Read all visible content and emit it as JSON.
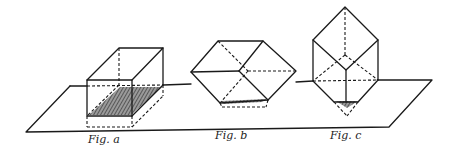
{
  "diagram": {
    "line_color": "#1a1a1a",
    "background": "#ffffff",
    "figures": [
      {
        "id": "a",
        "label": "Fig. a",
        "orientation": "resting on a face"
      },
      {
        "id": "b",
        "label": "Fig. b",
        "orientation": "resting on an edge"
      },
      {
        "id": "c",
        "label": "Fig. c",
        "orientation": "resting on a vertex"
      }
    ]
  }
}
